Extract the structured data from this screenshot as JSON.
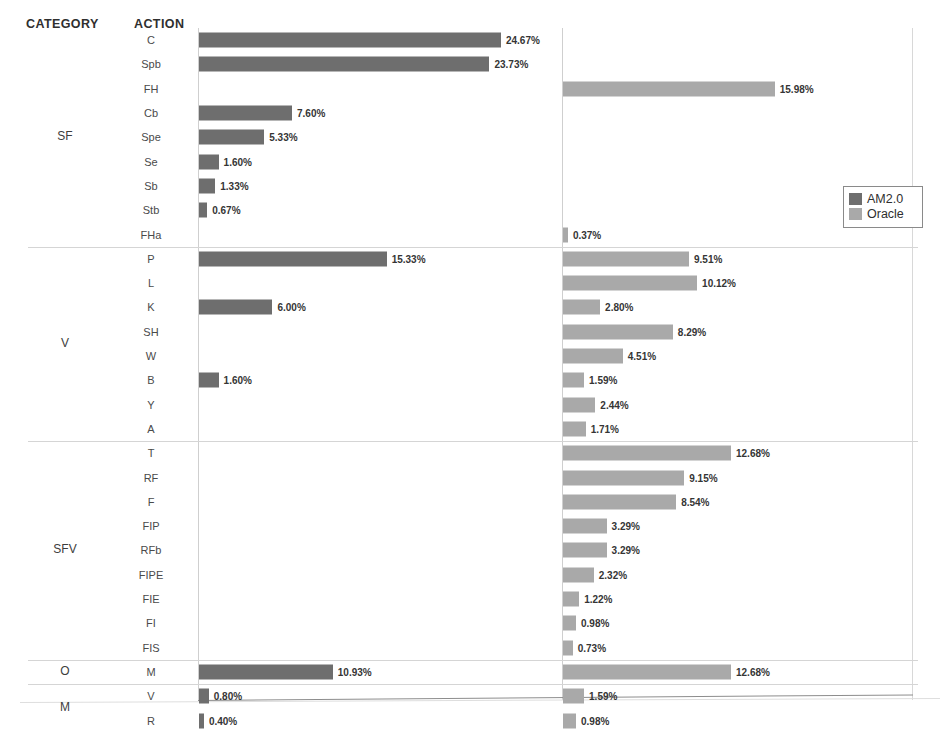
{
  "header": {
    "category_label": "CATEGORY",
    "action_label": "ACTION"
  },
  "legend": {
    "position": "right-middle",
    "entries": [
      {
        "name": "AM2.0",
        "color": "#6e6e6e"
      },
      {
        "name": "Oracle",
        "color": "#a9a9a9"
      }
    ]
  },
  "colors": {
    "am2_bar": "#6e6e6e",
    "oracle_bar": "#a9a9a9",
    "axis": "#cfcfcf",
    "separator": "#d5d5d5",
    "text": "#3a3a3a"
  },
  "chart_data": {
    "type": "bar",
    "title": "",
    "subtitle": "",
    "xlabel": "",
    "ylabel": "",
    "orientation": "horizontal",
    "layout": "paired-panels",
    "grid": false,
    "legend_position": "right-middle",
    "panels": [
      {
        "name": "AM2.0",
        "axis_x_px": 198,
        "px_per_percent": 12.24
      },
      {
        "name": "Oracle",
        "axis_x_px": 562,
        "px_per_percent": 13.25
      }
    ],
    "value_suffix": "%",
    "categories": [
      "SF",
      "V",
      "SFV",
      "O",
      "M"
    ],
    "series": [
      {
        "name": "AM2.0",
        "color": "#6e6e6e"
      },
      {
        "name": "Oracle",
        "color": "#a9a9a9"
      }
    ],
    "groups": [
      {
        "category": "SF",
        "rows": [
          {
            "action": "C",
            "am2": 24.67,
            "oracle": null,
            "am2_label": "24.67%",
            "oracle_label": ""
          },
          {
            "action": "Spb",
            "am2": 23.73,
            "oracle": null,
            "am2_label": "23.73%",
            "oracle_label": ""
          },
          {
            "action": "FH",
            "am2": null,
            "oracle": 15.98,
            "am2_label": "",
            "oracle_label": "15.98%"
          },
          {
            "action": "Cb",
            "am2": 7.6,
            "oracle": null,
            "am2_label": "7.60%",
            "oracle_label": ""
          },
          {
            "action": "Spe",
            "am2": 5.33,
            "oracle": null,
            "am2_label": "5.33%",
            "oracle_label": ""
          },
          {
            "action": "Se",
            "am2": 1.6,
            "oracle": null,
            "am2_label": "1.60%",
            "oracle_label": ""
          },
          {
            "action": "Sb",
            "am2": 1.33,
            "oracle": null,
            "am2_label": "1.33%",
            "oracle_label": ""
          },
          {
            "action": "Stb",
            "am2": 0.67,
            "oracle": null,
            "am2_label": "0.67%",
            "oracle_label": ""
          },
          {
            "action": "FHa",
            "am2": null,
            "oracle": 0.37,
            "am2_label": "",
            "oracle_label": "0.37%"
          }
        ]
      },
      {
        "category": "V",
        "rows": [
          {
            "action": "P",
            "am2": 15.33,
            "oracle": 9.51,
            "am2_label": "15.33%",
            "oracle_label": "9.51%"
          },
          {
            "action": "L",
            "am2": null,
            "oracle": 10.12,
            "am2_label": "",
            "oracle_label": "10.12%"
          },
          {
            "action": "K",
            "am2": 6.0,
            "oracle": 2.8,
            "am2_label": "6.00%",
            "oracle_label": "2.80%"
          },
          {
            "action": "SH",
            "am2": null,
            "oracle": 8.29,
            "am2_label": "",
            "oracle_label": "8.29%"
          },
          {
            "action": "W",
            "am2": null,
            "oracle": 4.51,
            "am2_label": "",
            "oracle_label": "4.51%"
          },
          {
            "action": "B",
            "am2": 1.6,
            "oracle": 1.59,
            "am2_label": "1.60%",
            "oracle_label": "1.59%"
          },
          {
            "action": "Y",
            "am2": null,
            "oracle": 2.44,
            "am2_label": "",
            "oracle_label": "2.44%"
          },
          {
            "action": "A",
            "am2": null,
            "oracle": 1.71,
            "am2_label": "",
            "oracle_label": "1.71%"
          }
        ]
      },
      {
        "category": "SFV",
        "rows": [
          {
            "action": "T",
            "am2": null,
            "oracle": 12.68,
            "am2_label": "",
            "oracle_label": "12.68%"
          },
          {
            "action": "RF",
            "am2": null,
            "oracle": 9.15,
            "am2_label": "",
            "oracle_label": "9.15%"
          },
          {
            "action": "F",
            "am2": null,
            "oracle": 8.54,
            "am2_label": "",
            "oracle_label": "8.54%"
          },
          {
            "action": "FIP",
            "am2": null,
            "oracle": 3.29,
            "am2_label": "",
            "oracle_label": "3.29%"
          },
          {
            "action": "RFb",
            "am2": null,
            "oracle": 3.29,
            "am2_label": "",
            "oracle_label": "3.29%"
          },
          {
            "action": "FIPE",
            "am2": null,
            "oracle": 2.32,
            "am2_label": "",
            "oracle_label": "2.32%"
          },
          {
            "action": "FIE",
            "am2": null,
            "oracle": 1.22,
            "am2_label": "",
            "oracle_label": "1.22%"
          },
          {
            "action": "FI",
            "am2": null,
            "oracle": 0.98,
            "am2_label": "",
            "oracle_label": "0.98%"
          },
          {
            "action": "FIS",
            "am2": null,
            "oracle": 0.73,
            "am2_label": "",
            "oracle_label": "0.73%"
          }
        ]
      },
      {
        "category": "O",
        "rows": [
          {
            "action": "M",
            "am2": 10.93,
            "oracle": 12.68,
            "am2_label": "10.93%",
            "oracle_label": "12.68%"
          }
        ]
      },
      {
        "category": "M",
        "rows": [
          {
            "action": "V",
            "am2": 0.8,
            "oracle": 1.59,
            "am2_label": "0.80%",
            "oracle_label": "1.59%"
          },
          {
            "action": "R",
            "am2": 0.4,
            "oracle": 0.98,
            "am2_label": "0.40%",
            "oracle_label": "0.98%"
          }
        ]
      }
    ]
  }
}
